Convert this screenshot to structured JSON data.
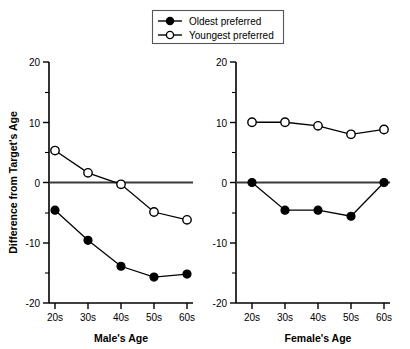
{
  "chart_data": {
    "type": "line",
    "title": "",
    "panels": [
      {
        "name": "male-panel",
        "xlabel": "Male's Age",
        "ylabel": "Difference from Target's Age",
        "categories": [
          "20s",
          "30s",
          "40s",
          "50s",
          "60s"
        ],
        "ylim": [
          -20,
          20
        ],
        "yticks": [
          20,
          10,
          0,
          -10,
          -20
        ],
        "yticklabels": [
          "20",
          "10",
          "0",
          "-10",
          "-20"
        ],
        "grid": false,
        "series": [
          {
            "name": "Oldest preferred",
            "marker": "filled-circle",
            "values": [
              -4.6,
              -9.6,
              -13.9,
              -15.7,
              -15.2
            ]
          },
          {
            "name": "Youngest preferred",
            "marker": "open-circle",
            "values": [
              5.3,
              1.6,
              -0.3,
              -4.9,
              -6.2
            ]
          }
        ]
      },
      {
        "name": "female-panel",
        "xlabel": "Female's Age",
        "ylabel": "",
        "categories": [
          "20s",
          "30s",
          "40s",
          "50s",
          "60s"
        ],
        "ylim": [
          -20,
          20
        ],
        "yticks": [
          20,
          10,
          0,
          -10,
          -20
        ],
        "yticklabels": [
          "20",
          "10",
          "0",
          "-10",
          "-20"
        ],
        "grid": false,
        "series": [
          {
            "name": "Oldest preferred",
            "marker": "filled-circle",
            "values": [
              0.0,
              -4.6,
              -4.6,
              -5.6,
              0.0
            ]
          },
          {
            "name": "Youngest preferred",
            "marker": "open-circle",
            "values": [
              10.0,
              10.0,
              9.4,
              8.0,
              8.8
            ]
          }
        ]
      }
    ],
    "legend": {
      "position": "top-center",
      "entries": [
        {
          "label": "Oldest preferred",
          "marker": "filled-circle"
        },
        {
          "label": "Youngest preferred",
          "marker": "open-circle"
        }
      ]
    }
  }
}
